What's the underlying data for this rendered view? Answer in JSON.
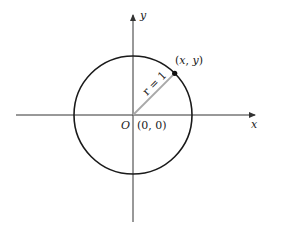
{
  "diagram": {
    "type": "unit-circle",
    "colors": {
      "background": "#ffffff",
      "axes": "#333333",
      "circle": "#1a1a1a",
      "radius": "#a8a8a8",
      "point": "#111111",
      "text": "#222222"
    },
    "geometry": {
      "origin": [
        133,
        115
      ],
      "radius_px": 59,
      "x_axis": {
        "from": 16,
        "to": 257
      },
      "y_axis": {
        "from": 222,
        "to": 13
      },
      "point_angle_deg": 45
    },
    "labels": {
      "x_axis": "x",
      "y_axis": "y",
      "origin_letter": "O",
      "origin_coords": "(0, 0)",
      "point": "(x, y)",
      "radius": "r = 1"
    }
  }
}
